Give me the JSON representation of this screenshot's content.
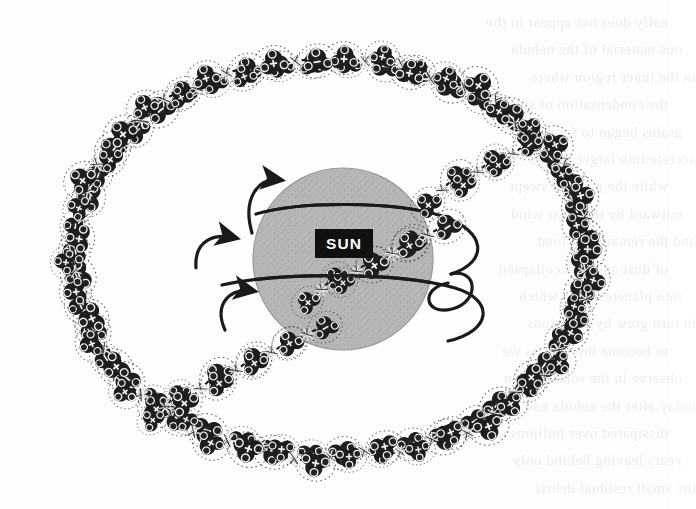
{
  "figure": {
    "background_color": "#fdfdfc",
    "ink_color": "#1a1a1a"
  },
  "sun": {
    "label": "SUN",
    "label_background": "#111111",
    "label_text_color": "#ffffff",
    "fill_color": "#b4b4b2",
    "edge_color": "#9a9a98",
    "center_x": 343,
    "center_y": 259,
    "radius_x": 90,
    "radius_y": 91
  },
  "orbit_rings": [
    {
      "name": "upper-orbit-band",
      "stroke": "#1a1a1a",
      "width": 3.2
    },
    {
      "name": "lower-orbit-band",
      "stroke": "#1a1a1a",
      "width": 3.2
    },
    {
      "name": "outer-loop-band",
      "stroke": "#1a1a1a",
      "width": 3.2
    }
  ],
  "arrows": [
    {
      "name": "rotation-arrow-top",
      "direction": "clockwise",
      "x": 288,
      "y": 179
    },
    {
      "name": "rotation-arrow-middle",
      "direction": "clockwise",
      "x": 243,
      "y": 239
    },
    {
      "name": "rotation-arrow-bottom",
      "direction": "clockwise",
      "x": 262,
      "y": 293
    }
  ],
  "particles": {
    "cluster_count": 74,
    "node_symbols": [
      "+",
      "-"
    ],
    "body_color": "#1d1d1d",
    "node_fill": "#2b2b2b",
    "node_ring": "#f2f2f2",
    "halo_style": "dotted",
    "bond_style": "dashed",
    "description": "Paired tetrahedral molecule clusters joined by dashed bonds with collision sparks"
  },
  "ring_layout": {
    "outer_ring": {
      "name": "outer-particle-ring",
      "center_x": 330,
      "center_y": 258,
      "radius_x": 258,
      "radius_y": 200,
      "pair_count": 46
    },
    "inner_band": {
      "name": "inner-particle-spiral",
      "pair_count": 12,
      "angle_deg": -38
    }
  },
  "ghost_text": {
    "note": "Faint show-through of printed text from reverse page",
    "lines": [
      "nally does not appear in the",
      "ous material of the nebula",
      "in the inner region where",
      "the condensation of solid",
      "grains began to form and",
      "accrete into larger bodies",
      "while the gas was swept",
      "outward by the solar wind",
      "and the remaining cloud",
      "of dust and ices collapsed",
      "into planetesimals which",
      "in turn grew by collisions",
      "to become the planets we",
      "observe in the solar system",
      "today after the nebula had",
      "dissipated over millions of",
      "years leaving behind only",
      "the small residual debris"
    ]
  }
}
